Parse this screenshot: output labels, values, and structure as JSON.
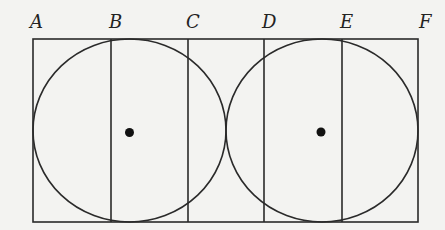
{
  "diagram": {
    "stroke_color": "#2a2a2a",
    "background_color": "#f3f3f1",
    "rectangle": {
      "x1": 33,
      "y1": 39,
      "x2": 418,
      "y2": 222
    },
    "labels": [
      {
        "id": "A",
        "text": "A",
        "x": 30
      },
      {
        "id": "B",
        "text": "B",
        "x": 109
      },
      {
        "id": "C",
        "text": "C",
        "x": 186
      },
      {
        "id": "D",
        "text": "D",
        "x": 262
      },
      {
        "id": "E",
        "text": "E",
        "x": 340
      },
      {
        "id": "F",
        "text": "F",
        "x": 419
      }
    ],
    "vertical_lines": [
      {
        "label": "B",
        "x": 111
      },
      {
        "label": "C",
        "x": 188
      },
      {
        "label": "D",
        "x": 264
      },
      {
        "label": "E",
        "x": 342
      }
    ],
    "circles": [
      {
        "name": "left-circle",
        "cx": 129.5,
        "cy": 130.5,
        "rx": 96.5,
        "ry": 91.5
      },
      {
        "name": "right-circle",
        "cx": 322,
        "cy": 130.5,
        "rx": 96,
        "ry": 91.5
      }
    ],
    "center_dots": [
      {
        "name": "left-center",
        "cx": 129.5,
        "cy": 132.5,
        "r": 4.5
      },
      {
        "name": "right-center",
        "cx": 321,
        "cy": 132,
        "r": 4.5
      }
    ]
  }
}
